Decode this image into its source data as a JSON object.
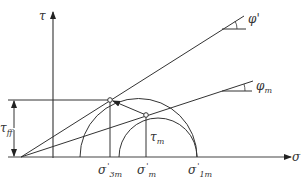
{
  "diagram": {
    "type": "mohr-coulomb-stress-path",
    "axes": {
      "y_label": "τ",
      "x_label": "σ'"
    },
    "lines": [
      {
        "name": "failure-envelope",
        "angle_label": "φ'"
      },
      {
        "name": "mobilized-envelope",
        "angle_label": "φ",
        "angle_sub": "m"
      }
    ],
    "labels": {
      "tau_ff": {
        "main": "τ",
        "sub": "ff"
      },
      "tau_m": {
        "main": "τ",
        "sub": "m"
      },
      "sigma_3m": {
        "main": "σ",
        "prime": "'",
        "sub": "3m"
      },
      "sigma_m": {
        "main": "σ",
        "prime": "'",
        "sub": "m"
      },
      "sigma_1m": {
        "main": "σ",
        "prime": "'",
        "sub": "1m"
      }
    },
    "colors": {
      "stroke": "#333333",
      "background": "#ffffff"
    }
  }
}
